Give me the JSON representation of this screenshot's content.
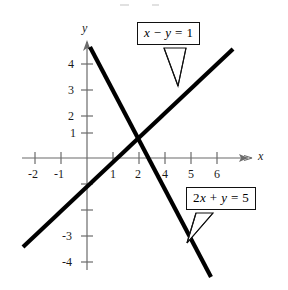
{
  "figure": {
    "kind": "coordinate-plane-graph",
    "background_color": "#ffffff",
    "line_color": "#000000",
    "axis_color": "#6b6b6b",
    "text_color": "#1a1a1a"
  },
  "axes": {
    "x_axis_label": "x",
    "y_axis_label": "y",
    "x_tick_labels": [
      "-2",
      "-1",
      "1",
      "2",
      "4",
      "5",
      "6"
    ],
    "y_tick_labels": [
      "4",
      "3",
      "2",
      "1",
      "-3",
      "-4"
    ],
    "x_unlabeled_ticks": [
      "3"
    ],
    "y_unlabeled_ticks": [
      "-1",
      "-2"
    ]
  },
  "callouts": [
    {
      "id": "xy1",
      "text": "x − y = 1"
    },
    {
      "id": "2xy5",
      "text": "2x + y = 5"
    }
  ],
  "chart_data": {
    "type": "line",
    "title": "",
    "xlabel": "x",
    "ylabel": "y",
    "xlim": [
      -2.6,
      7.0
    ],
    "ylim": [
      -4.6,
      4.8
    ],
    "grid": false,
    "legend": "callout-boxes",
    "xticks": [
      -2,
      -1,
      1,
      2,
      3,
      4,
      5,
      6
    ],
    "yticks": [
      4,
      3,
      2,
      1,
      -1,
      -2,
      -3,
      -4
    ],
    "xtick_labels": [
      "-2",
      "-1",
      "1",
      "2",
      "",
      "4",
      "5",
      "6"
    ],
    "ytick_labels": [
      "4",
      "3",
      "2",
      "1",
      "",
      "",
      "-3",
      "-4"
    ],
    "annotations": [
      {
        "text": "x − y = 1",
        "points_to_series": "x - y = 1",
        "point": [
          4.0,
          3.0
        ]
      },
      {
        "text": "2x + y = 5",
        "points_to_series": "2x + y = 5",
        "point": [
          4.2,
          -3.3
        ]
      }
    ],
    "intersection": [
      2,
      1
    ],
    "series": [
      {
        "name": "x - y = 1",
        "equation": "x - y = 1",
        "slope": 1,
        "intercept": -1,
        "x_intercept": 1,
        "y_intercept": -1,
        "endpoints": [
          [
            -2.4,
            -3.4
          ],
          [
            5.6,
            4.6
          ]
        ],
        "label": "x − y = 1"
      },
      {
        "name": "2x + y = 5",
        "equation": "2x + y = 5",
        "slope": -2,
        "intercept": 5,
        "x_intercept": 2.5,
        "y_intercept": 5,
        "endpoints": [
          [
            0.1,
            4.8
          ],
          [
            4.7,
            -4.4
          ]
        ],
        "label": "2x + y = 5"
      }
    ]
  }
}
